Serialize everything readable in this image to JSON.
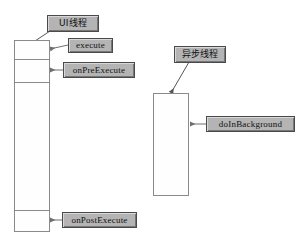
{
  "diagram": {
    "background_color": "#ffffff",
    "line_color": "#8a8a8a",
    "label_fill_color": "#b4b4b4",
    "label_border_color": "#4a4a4a",
    "text_color": "#111111"
  },
  "lifelines": [
    {
      "id": "ui-thread",
      "name": "UI thread lifeline",
      "segments": [
        "execute",
        "onPreExecute",
        "running",
        "onPostExecute"
      ]
    },
    {
      "id": "async-thread",
      "name": "Async thread lifeline",
      "segments": [
        "doInBackground"
      ]
    }
  ],
  "labels": {
    "ui_thread": "UI线程",
    "execute": "execute",
    "on_pre_execute": "onPreExecute",
    "on_post_execute": "onPostExecute",
    "async_thread": "异步线程",
    "do_in_background": "doInBackground"
  },
  "connectors": [
    {
      "name": "ui-thread-pointer",
      "kind": "diagonal-arrow",
      "from": "UI线程",
      "to": "ui-thread lifeline top"
    },
    {
      "name": "execute-pointer",
      "kind": "horizontal-arrow",
      "from": "execute",
      "to": "ui-thread segment 1"
    },
    {
      "name": "on-pre-execute-pointer",
      "kind": "horizontal-arrow",
      "from": "onPreExecute",
      "to": "ui-thread segment 2"
    },
    {
      "name": "on-post-execute-pointer",
      "kind": "horizontal-arrow",
      "from": "onPostExecute",
      "to": "ui-thread segment 4"
    },
    {
      "name": "async-thread-pointer",
      "kind": "diagonal-arrow",
      "from": "异步线程",
      "to": "async-thread lifeline top"
    },
    {
      "name": "do-in-background-pointer",
      "kind": "horizontal-arrow",
      "from": "doInBackground",
      "to": "async-thread lifeline"
    }
  ]
}
